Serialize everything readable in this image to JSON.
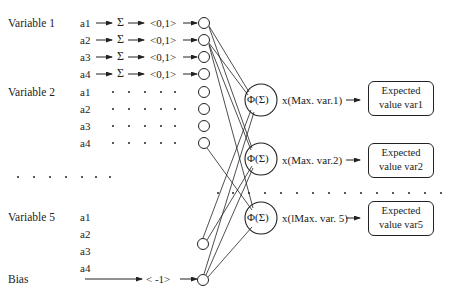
{
  "variables": [
    {
      "label": "Variable 1",
      "inputs": [
        "a1",
        "a2",
        "a3",
        "a4"
      ]
    },
    {
      "label": "Variable 2",
      "inputs": [
        "a1",
        "a2",
        "a3",
        "a4"
      ]
    },
    {
      "label": "Variable 5",
      "inputs": [
        "a1",
        "a2",
        "a3",
        "a4"
      ]
    }
  ],
  "bias": {
    "label": "Bias",
    "value": "< -1>"
  },
  "sum_symbol": "Σ",
  "normalize_label": "<0,1>",
  "ellipsis": "· · · · · ·",
  "hidden_nodes": [
    {
      "label": "Φ(Σ)",
      "scale": "x(Max. var.1)",
      "output": [
        "Expected",
        "value var1"
      ]
    },
    {
      "label": "Φ(Σ)",
      "scale": "x(Max. var.2)",
      "output": [
        "Expected",
        "value var2"
      ]
    },
    {
      "label": "Φ(Σ)",
      "scale": "x(lMax. var. 5)",
      "output": [
        "Expected",
        "value var5"
      ]
    }
  ]
}
